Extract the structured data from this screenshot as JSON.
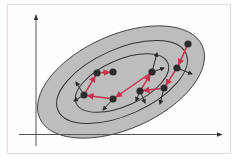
{
  "figure": {
    "colors": {
      "background": "#fefefe",
      "border": "#ecd6da",
      "ellipse_fill": "#bdbdbd",
      "contour_line": "#333333",
      "axis": "#444444",
      "point": "#2b2b2b",
      "path_arrow": "#c8304f",
      "gradient_arrow": "#2b2b2b"
    },
    "axes": {
      "x_axis_label": "",
      "y_axis_label": ""
    },
    "contours": [
      {
        "cx": 121,
        "cy": 82,
        "rx": 89,
        "ry": 47,
        "rotate": -24,
        "filled": true
      },
      {
        "cx": 122,
        "cy": 82,
        "rx": 70,
        "ry": 33,
        "rotate": -24,
        "filled": false
      },
      {
        "cx": 122,
        "cy": 83,
        "rx": 50,
        "ry": 23,
        "rotate": -24,
        "filled": false
      }
    ],
    "points": [
      {
        "x": 188,
        "y": 44
      },
      {
        "x": 177,
        "y": 68
      },
      {
        "x": 164,
        "y": 88
      },
      {
        "x": 140,
        "y": 91
      },
      {
        "x": 152,
        "y": 72
      },
      {
        "x": 113,
        "y": 99
      },
      {
        "x": 84,
        "y": 95
      },
      {
        "x": 97,
        "y": 73
      },
      {
        "x": 113,
        "y": 72
      }
    ],
    "gradient_arrows": [
      {
        "x1": 177,
        "y1": 68,
        "x2": 192,
        "y2": 74
      },
      {
        "x1": 164,
        "y1": 88,
        "x2": 160,
        "y2": 104
      },
      {
        "x1": 140,
        "y1": 91,
        "x2": 136,
        "y2": 101
      },
      {
        "x1": 140,
        "y1": 91,
        "x2": 145,
        "y2": 103
      },
      {
        "x1": 152,
        "y1": 72,
        "x2": 157,
        "y2": 53
      },
      {
        "x1": 152,
        "y1": 72,
        "x2": 164,
        "y2": 68
      },
      {
        "x1": 113,
        "y1": 99,
        "x2": 103,
        "y2": 110
      },
      {
        "x1": 84,
        "y1": 95,
        "x2": 74,
        "y2": 101
      },
      {
        "x1": 84,
        "y1": 95,
        "x2": 76,
        "y2": 82
      }
    ]
  }
}
